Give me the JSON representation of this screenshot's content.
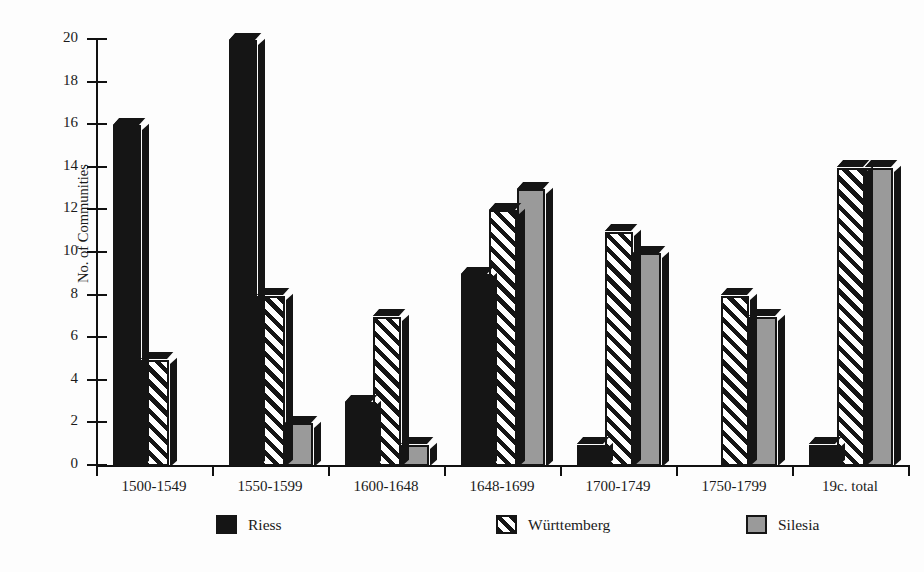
{
  "chart_data": {
    "type": "bar",
    "title": "",
    "xlabel": "",
    "ylabel": "No. of Communities",
    "ylim": [
      0,
      20
    ],
    "ytick_values": [
      0,
      2,
      4,
      6,
      8,
      10,
      12,
      14,
      16,
      18,
      20
    ],
    "ytick_labels": [
      "0",
      "2",
      "4",
      "6",
      "8",
      "10",
      "12",
      "14",
      "16",
      "18",
      "20"
    ],
    "grid": false,
    "legend_position": "bottom",
    "categories": [
      "1500-1549",
      "1550-1599",
      "1600-1648",
      "1648-1699",
      "1700-1749",
      "1750-1799",
      "19c. total"
    ],
    "series": [
      {
        "name": "Riess",
        "color": "#151515",
        "pattern": "solid-black",
        "values": [
          16,
          20,
          3,
          9,
          1,
          0,
          1
        ]
      },
      {
        "name": "Württemberg",
        "color": "#151515",
        "pattern": "diagonal-hatch",
        "values": [
          5,
          8,
          7,
          12,
          11,
          8,
          14
        ]
      },
      {
        "name": "Silesia",
        "color": "#9a9a9a",
        "pattern": "solid-gray",
        "values": [
          0,
          2,
          1,
          13,
          10,
          7,
          14
        ]
      }
    ]
  },
  "legend": {
    "items": [
      {
        "label": "Riess",
        "swatch": "solid-black"
      },
      {
        "label": "Württemberg",
        "swatch": "diagonal-hatch"
      },
      {
        "label": "Silesia",
        "swatch": "solid-gray"
      }
    ]
  },
  "colors": {
    "background": "#fdfdfd",
    "ink": "#151515",
    "gray": "#9a9a9a"
  }
}
